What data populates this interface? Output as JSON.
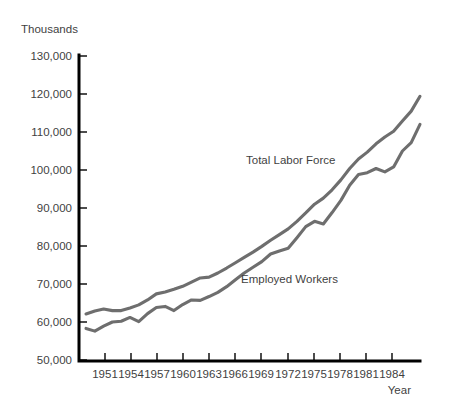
{
  "chart_data": {
    "type": "line",
    "title": "",
    "subtitle": "",
    "xlabel": "Year",
    "ylabel": "Thousands",
    "xlim": [
      1947.2,
      1986.0
    ],
    "ylim": [
      50000,
      130000
    ],
    "grid": false,
    "legend_position": "inline-annotation",
    "ytick_labels": [
      "130,000",
      "120,000",
      "110,000",
      "100,000",
      "90,000",
      "80,000",
      "70,000",
      "60,000",
      "50,000"
    ],
    "ytick_values": [
      130000,
      120000,
      110000,
      100000,
      90000,
      80000,
      70000,
      60000,
      50000
    ],
    "xtick_labels": [
      "1951",
      "1954",
      "1957",
      "1960",
      "1963",
      "1966",
      "1969",
      "1972",
      "1975",
      "1978",
      "1981",
      "1984"
    ],
    "xtick_values": [
      1951,
      1954,
      1957,
      1960,
      1963,
      1966,
      1969,
      1972,
      1975,
      1978,
      1981,
      1984
    ],
    "x": [
      1948,
      1949,
      1950,
      1951,
      1952,
      1953,
      1954,
      1955,
      1956,
      1957,
      1958,
      1959,
      1960,
      1961,
      1962,
      1963,
      1964,
      1965,
      1966,
      1967,
      1968,
      1969,
      1970,
      1971,
      1972,
      1973,
      1974,
      1975,
      1976,
      1977,
      1978,
      1979,
      1980,
      1981,
      1982,
      1983,
      1984,
      1985,
      1986
    ],
    "series": [
      {
        "name": "Total Labor Force",
        "color": "#6e6e6e",
        "values": [
          62100,
          62900,
          63400,
          63000,
          63000,
          63700,
          64500,
          65800,
          67400,
          67900,
          68600,
          69400,
          70500,
          71600,
          71800,
          72900,
          74200,
          75600,
          77000,
          78400,
          79900,
          81500,
          83000,
          84500,
          86500,
          88700,
          91000,
          92600,
          94800,
          97400,
          100400,
          102900,
          104700,
          106900,
          108700,
          110200,
          112900,
          115500,
          119400
        ]
      },
      {
        "name": "Employed Workers",
        "color": "#6e6e6e",
        "values": [
          58300,
          57600,
          58900,
          60000,
          60200,
          61200,
          60100,
          62200,
          63800,
          64100,
          63000,
          64600,
          65800,
          65700,
          66700,
          67800,
          69300,
          71100,
          72900,
          74400,
          75900,
          77900,
          78700,
          79400,
          82200,
          85100,
          86500,
          85800,
          88800,
          92000,
          96000,
          98800,
          99300,
          100400,
          99500,
          100800,
          105000,
          107200,
          112000
        ]
      }
    ],
    "annotations": [
      {
        "text": "Total Labor Force",
        "x_px": 246,
        "y_px": 164
      },
      {
        "text": "Employed Workers",
        "x_px": 241,
        "y_px": 283
      }
    ]
  },
  "axis_titles": {
    "y": "Thousands",
    "x": "Year"
  }
}
